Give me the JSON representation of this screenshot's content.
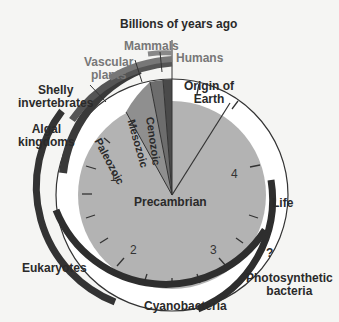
{
  "title": "Billions of years ago",
  "center_label": "Precambrian",
  "eras": [
    "Paleozoic",
    "Mesozoic",
    "Cenozoic"
  ],
  "ticks": [
    "1",
    "2",
    "3",
    "4"
  ],
  "labels": {
    "mammals": "Mammals",
    "humans": "Humans",
    "vascular_plants": [
      "Vascular",
      "plants"
    ],
    "shelly_invertebrates": [
      "Shelly",
      "invertebrates"
    ],
    "algal_kingdoms": [
      "Algal",
      "kingdoms"
    ],
    "origin_of_earth": [
      "Origin of",
      "Earth"
    ],
    "life": "Life",
    "question": "?",
    "photosynthetic_bacteria": [
      "Photosynthetic",
      "bacteria"
    ],
    "eukaryotes": "Eukaryotes",
    "cyanobacteria": "Cyanobacteria"
  },
  "colors": {
    "disc": "#b3b3b3",
    "arc_dark": "#2e2e2e",
    "arc_mid": "#555555",
    "arc_light": "#7a7a7a",
    "wedge_paleozoic": "#8a8a8a",
    "wedge_mesozoic": "#6e6e6e",
    "wedge_cenozoic": "#4a4a4a"
  }
}
